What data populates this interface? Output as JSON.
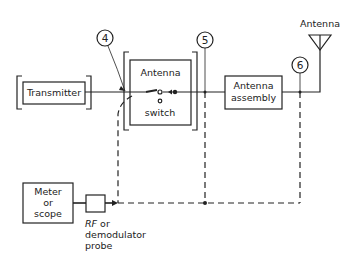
{
  "diagram": {
    "type": "block-diagram",
    "blocks": {
      "transmitter": {
        "label": "Transmitter"
      },
      "antenna_switch": {
        "label_top": "Antenna",
        "label_bottom": "switch"
      },
      "antenna_assembly": {
        "label_line1": "Antenna",
        "label_line2": "assembly"
      },
      "antenna": {
        "label": "Antenna"
      },
      "meter": {
        "label_line1": "Meter",
        "label_line2": "or",
        "label_line3": "scope"
      },
      "probe": {
        "label_rf": "RF",
        "label_or": " or",
        "label_line2": "demodulator",
        "label_line3": "probe"
      }
    },
    "test_points": [
      {
        "id": "4",
        "label": "4"
      },
      {
        "id": "5",
        "label": "5"
      },
      {
        "id": "6",
        "label": "6"
      }
    ],
    "colors": {
      "line": "#222222",
      "background": "#ffffff"
    }
  }
}
